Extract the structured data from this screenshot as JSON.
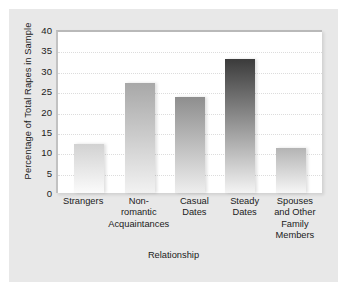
{
  "chart_data": {
    "type": "bar",
    "title": "",
    "xlabel": "Relationship",
    "ylabel": "Percentage of Total Rapes in Sample",
    "categories": [
      "Strangers",
      "Non-romantic Acquaintances",
      "Casual Dates",
      "Steady Dates",
      "Spouses and Other Family Members"
    ],
    "category_lines": [
      [
        "Strangers"
      ],
      [
        "Non-",
        "romantic",
        "Acquaintances"
      ],
      [
        "Casual",
        "Dates"
      ],
      [
        "Steady",
        "Dates"
      ],
      [
        "Spouses",
        "and Other",
        "Family",
        "Members"
      ]
    ],
    "values": [
      12,
      27,
      23.5,
      33,
      11
    ],
    "ylim": [
      0,
      40
    ],
    "yticks": [
      40,
      35,
      30,
      25,
      20,
      15,
      10,
      5,
      0
    ],
    "grid": true,
    "legend": "none",
    "bar_colors_top": [
      "#d2d2d2",
      "#a8a8a8",
      "#8e8e8e",
      "#3b3b3b",
      "#b4b4b4"
    ],
    "bar_colors_bottom": [
      "#fbfbfb",
      "#f2f2f2",
      "#eeeeee",
      "#f4f4f4",
      "#f6f6f6"
    ]
  },
  "style": {
    "card_background": "#e8e8e8",
    "plot_background": "#ffffff",
    "grid_color": "#dcdcdc",
    "text_color": "#1b1b1b"
  }
}
